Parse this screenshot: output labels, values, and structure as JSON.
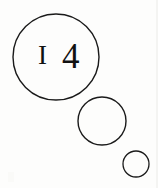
{
  "canvas": {
    "width": 158,
    "height": 188,
    "background_color": "#fdfdfc",
    "ink_color": "#1a1a1a",
    "text_color": "#111111"
  },
  "figure": {
    "caption_number": "I 4"
  },
  "label": {
    "full_text": "I 4",
    "glyph_one": "I",
    "glyph_two": "4",
    "glyph_one_size": 27,
    "glyph_two_size": 35,
    "glyph_one_x": 38,
    "glyph_two_x": 62,
    "baseline_y": 64
  },
  "shapes": [
    {
      "name": "large-circle",
      "cx": 56,
      "cy": 57,
      "r": 43,
      "stroke_width": 1.4,
      "stroke_color": "#1a1a1a",
      "fill": "none"
    },
    {
      "name": "medium-circle",
      "cx": 102,
      "cy": 121,
      "r": 24,
      "stroke_width": 1.4,
      "stroke_color": "#1a1a1a",
      "fill": "none"
    },
    {
      "name": "small-circle",
      "cx": 136,
      "cy": 164,
      "r": 13,
      "stroke_width": 1.3,
      "stroke_color": "#1a1a1a",
      "fill": "none"
    }
  ]
}
